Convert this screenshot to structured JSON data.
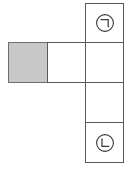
{
  "figure": {
    "type": "cube-net-diagram",
    "background_color": "#ffffff",
    "stroke_color": "#5a5a5a",
    "shaded_fill_color": "#c8c8c8",
    "cells": [
      {
        "id": "cell-top-right",
        "name": "net-cell-giyeok",
        "column": "right",
        "row": 1,
        "x": 85,
        "y": 3,
        "width": 39,
        "height": 39,
        "fill": "#ffffff",
        "label": "㉠",
        "label_glyph": "circled-giyeok",
        "label_reading": "giyeok"
      },
      {
        "id": "cell-row2-right",
        "name": "net-cell-right-second",
        "column": "right",
        "row": 2,
        "x": 85,
        "y": 42,
        "width": 39,
        "height": 40,
        "fill": "#ffffff",
        "label": "",
        "label_glyph": "",
        "label_reading": ""
      },
      {
        "id": "cell-row3-right",
        "name": "net-cell-right-third",
        "column": "right",
        "row": 3,
        "x": 85,
        "y": 82,
        "width": 39,
        "height": 40,
        "fill": "#ffffff",
        "label": "",
        "label_glyph": "",
        "label_reading": ""
      },
      {
        "id": "cell-bottom-right",
        "name": "net-cell-nieun",
        "column": "right",
        "row": 4,
        "x": 85,
        "y": 122,
        "width": 39,
        "height": 40,
        "fill": "#ffffff",
        "label": "㉡",
        "label_glyph": "circled-nieun",
        "label_reading": "nieun"
      },
      {
        "id": "cell-row2-left",
        "name": "net-cell-shaded",
        "column": "left",
        "row": 2,
        "x": 8,
        "y": 42,
        "width": 39,
        "height": 40,
        "fill": "#c8c8c8",
        "label": "",
        "label_glyph": "",
        "label_reading": ""
      },
      {
        "id": "cell-row2-middle",
        "name": "net-cell-middle",
        "column": "middle",
        "row": 2,
        "x": 47,
        "y": 42,
        "width": 38,
        "height": 40,
        "fill": "#ffffff",
        "label": "",
        "label_glyph": "",
        "label_reading": ""
      }
    ],
    "labels": {
      "giyeok": "㉠",
      "nieun": "㉡"
    }
  }
}
